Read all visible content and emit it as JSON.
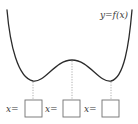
{
  "diagram": {
    "curve_label": "y=f(x)",
    "curve_description": "W-shaped curve with two local minima and one local maximum",
    "critical_points": [
      {
        "kind": "local minimum",
        "box_label": "x=",
        "box_value": ""
      },
      {
        "kind": "local maximum",
        "box_label": "x=",
        "box_value": ""
      },
      {
        "kind": "local minimum",
        "box_label": "x=",
        "box_value": ""
      }
    ],
    "colors": {
      "curve": "#2b2b2b",
      "dropline": "#9a9a9a",
      "box_border": "#707070",
      "text": "#3a3a3a"
    }
  }
}
